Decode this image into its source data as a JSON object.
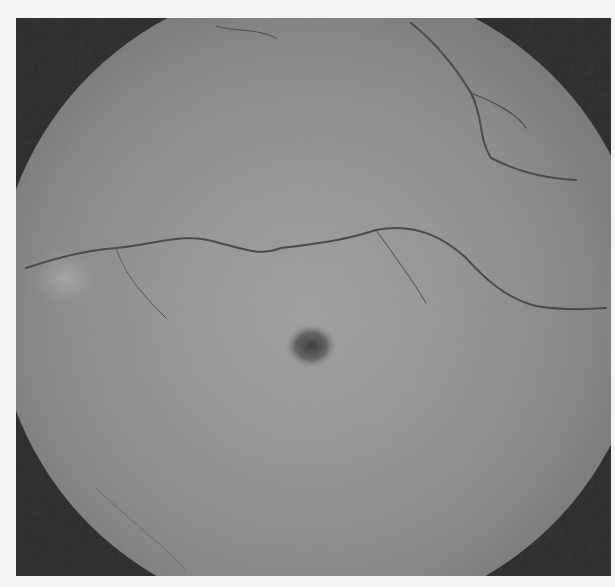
{
  "image": {
    "description": "Grayscale retinal fundus photograph with dark circular fovea at center and branching retinal vessels",
    "colors": {
      "background": "#f4f4f4",
      "fundus_mid": "#979797",
      "corner_dark": "#2e2e2e",
      "fovea": "#3c3c3c",
      "vessel": "#4a4a4a"
    }
  }
}
